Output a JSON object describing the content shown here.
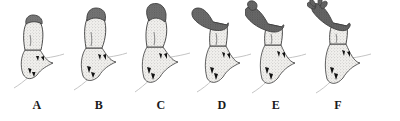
{
  "figure": {
    "background_color": "#ffffff",
    "width": 400,
    "height": 121,
    "panel_count": 6,
    "style": "stippled ink line drawing, grayscale",
    "caption_note": "Six sequential stages labelled A through F showing progressive elongation, curvature and terminal branching"
  },
  "colors": {
    "background": "#ffffff",
    "outline": "#2b2b2b",
    "cap_dark": "#6f6f6f",
    "cap_dark_edge": "#4a4a4a",
    "body_light": "#ededea",
    "stipple": "#8a8a8a",
    "base_mark": "#111111",
    "label_text": "#1a1a1a",
    "hairline": "#b9b9b9"
  },
  "panels": [
    {
      "id": "a",
      "label": "A",
      "stage": 1,
      "description": "Shortest stage; squat columnar body with small dark cap at apex, flared stippled base with dark chevron marks and a thin trailing hairline",
      "relative_height": 1.0,
      "cap_extent_percent": 18,
      "curvature": "straight",
      "apex_form": "rounded blunt",
      "branched": false,
      "lobe_count": 0
    },
    {
      "id": "b",
      "label": "B",
      "stage": 2,
      "description": "Taller than A; dark stippled cap enlarged and clearly demarcated from the pale body",
      "relative_height": 1.18,
      "cap_extent_percent": 26,
      "curvature": "straight",
      "apex_form": "rounded blunt",
      "branched": false,
      "lobe_count": 0
    },
    {
      "id": "c",
      "label": "C",
      "stage": 3,
      "description": "Further elongated; dark cap extends about a third down the shaft, apex begins to tilt to the left",
      "relative_height": 1.38,
      "cap_extent_percent": 34,
      "curvature": "slight left tilt",
      "apex_form": "obliquely rounded",
      "branched": false,
      "lobe_count": 0
    },
    {
      "id": "d",
      "label": "D",
      "stage": 4,
      "description": "Apex bends distinctly leftward forming a hooked dark region over a pale stippled stalk",
      "relative_height": 1.5,
      "cap_extent_percent": 45,
      "curvature": "hooked left",
      "apex_form": "club shaped, recurved",
      "branched": false,
      "lobe_count": 0
    },
    {
      "id": "e",
      "label": "E",
      "stage": 5,
      "description": "Strongly recurved dark distal region with a swollen knob-like terminal lobe; pale stippled base unchanged",
      "relative_height": 1.62,
      "cap_extent_percent": 52,
      "curvature": "strongly recurved",
      "apex_form": "swollen knob",
      "branched": false,
      "lobe_count": 1
    },
    {
      "id": "f",
      "label": "F",
      "stage": 6,
      "description": "Tallest stage; elongated recurved dark arm terminating in finger-like branched lobes resembling a small hand or antler",
      "relative_height": 1.82,
      "cap_extent_percent": 58,
      "curvature": "strongly recurved",
      "apex_form": "digitate, branched",
      "branched": true,
      "lobe_count": 4
    }
  ]
}
